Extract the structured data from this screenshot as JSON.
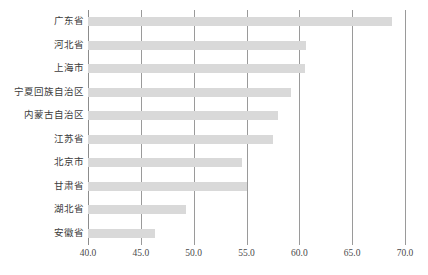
{
  "chart_data": {
    "type": "bar",
    "orientation": "horizontal",
    "title": "",
    "subtitle": "",
    "xlabel": "",
    "ylabel": "",
    "categories": [
      "广东省",
      "河北省",
      "上海市",
      "宁夏回族自治区",
      "内蒙古自治区",
      "江苏省",
      "北京市",
      "甘肃省",
      "湖北省",
      "安徽省"
    ],
    "values": [
      68.8,
      60.6,
      60.5,
      59.2,
      58.0,
      57.5,
      54.6,
      55.0,
      49.3,
      46.3
    ],
    "xlim": [
      40.0,
      70.0
    ],
    "xticks": [
      40.0,
      45.0,
      50.0,
      55.0,
      60.0,
      65.0,
      70.0
    ],
    "xtick_labels": [
      "40.0",
      "45.0",
      "50.0",
      "55.0",
      "60.0",
      "65.0",
      "70.0"
    ],
    "grid": "vertical",
    "legend": "none",
    "bar_color": "#d9d9d9",
    "gridline_color": "#9a9a9a",
    "axis_color": "#8c8c8c"
  },
  "caption": {
    "text": ""
  }
}
